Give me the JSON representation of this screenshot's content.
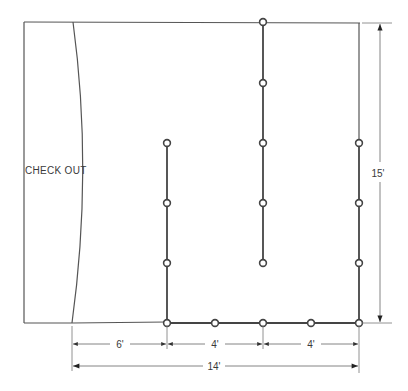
{
  "diagram": {
    "title": "",
    "area_label": "CHECK OUT",
    "colors": {
      "outline": "#555555",
      "post_line": "#444444",
      "post_ring": "#444444",
      "dimension": "#666666",
      "text": "#3a3a3a"
    },
    "dimensions": {
      "width_total": "14'",
      "height_total": "15'",
      "segment_1": "6'",
      "segment_2": "4'",
      "segment_3": "4'"
    },
    "stanchion_lines": [
      {
        "id": "left-line",
        "posts": 4
      },
      {
        "id": "center-line",
        "posts": 5
      },
      {
        "id": "right-line",
        "posts": 4
      },
      {
        "id": "bottom-line",
        "posts": 5
      }
    ]
  }
}
